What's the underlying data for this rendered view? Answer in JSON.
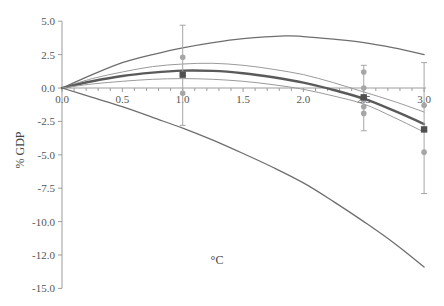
{
  "chart_data": {
    "type": "line",
    "title": "",
    "xlabel": "°C",
    "ylabel": "% GDP",
    "xlim": [
      0,
      3.0
    ],
    "ylim": [
      -15.0,
      5.0
    ],
    "grid": false,
    "legend": null,
    "x_ticks": [
      "0.0",
      "0.5",
      "1.0",
      "1.5",
      "2.0",
      "2.5",
      "3.0"
    ],
    "y_ticks": [
      "5.0",
      "2.5",
      "0.0",
      "-2.5",
      "-5.0",
      "-7.5",
      "-10.0",
      "-12.0",
      "-15.0"
    ],
    "y_tick_values": [
      5.0,
      2.5,
      0.0,
      -2.5,
      -5.0,
      -7.5,
      -10.0,
      -12.5,
      -15.0
    ],
    "series": [
      {
        "name": "upper bound",
        "style": "thin-dark",
        "color": "#6e6e6e",
        "width": 1.3,
        "x": [
          0,
          0.25,
          0.5,
          0.75,
          1.0,
          1.25,
          1.5,
          1.85,
          2.0,
          2.25,
          2.5,
          2.75,
          3.0
        ],
        "y": [
          0,
          1.0,
          1.9,
          2.5,
          3.0,
          3.4,
          3.7,
          3.9,
          3.85,
          3.65,
          3.4,
          3.0,
          2.5
        ]
      },
      {
        "name": "upper central",
        "style": "thin-light",
        "color": "#9a9a9a",
        "width": 1.0,
        "x": [
          0,
          0.25,
          0.5,
          0.75,
          1.0,
          1.25,
          1.5,
          1.75,
          2.0,
          2.25,
          2.5,
          2.75,
          3.0
        ],
        "y": [
          0,
          0.7,
          1.2,
          1.6,
          1.8,
          1.85,
          1.7,
          1.4,
          1.0,
          0.4,
          -0.3,
          -1.0,
          -1.8
        ]
      },
      {
        "name": "central estimate",
        "style": "thick",
        "color": "#5a5a5a",
        "width": 2.4,
        "x": [
          0,
          0.25,
          0.5,
          0.75,
          1.0,
          1.25,
          1.5,
          1.75,
          2.0,
          2.25,
          2.5,
          2.75,
          3.0
        ],
        "y": [
          0,
          0.5,
          0.9,
          1.15,
          1.3,
          1.28,
          1.1,
          0.8,
          0.4,
          -0.15,
          -0.8,
          -1.7,
          -2.7
        ]
      },
      {
        "name": "lower central",
        "style": "thin-light",
        "color": "#9a9a9a",
        "width": 1.0,
        "x": [
          0,
          0.25,
          0.5,
          0.75,
          1.0,
          1.25,
          1.5,
          1.75,
          2.0,
          2.25,
          2.5,
          2.75,
          3.0
        ],
        "y": [
          0,
          0.3,
          0.5,
          0.65,
          0.7,
          0.65,
          0.5,
          0.25,
          -0.1,
          -0.6,
          -1.2,
          -2.2,
          -3.3
        ]
      },
      {
        "name": "lower bound",
        "style": "thin-dark",
        "color": "#6e6e6e",
        "width": 1.3,
        "x": [
          0,
          0.25,
          0.5,
          0.75,
          1.0,
          1.25,
          1.5,
          1.75,
          2.0,
          2.25,
          2.5,
          2.75,
          3.0
        ],
        "y": [
          0,
          -0.7,
          -1.4,
          -2.2,
          -3.0,
          -3.9,
          -4.9,
          -5.95,
          -7.1,
          -8.5,
          -10.0,
          -11.6,
          -13.4
        ]
      }
    ],
    "error_bars": [
      {
        "x": 1.0,
        "mean": 1.0,
        "upper": 4.7,
        "lower": -2.8,
        "points": [
          2.3,
          -0.4
        ]
      },
      {
        "x": 2.5,
        "mean": -0.7,
        "upper": 1.7,
        "lower": -3.2,
        "points": [
          1.2,
          0.0,
          -0.9,
          -1.4,
          -1.9
        ]
      },
      {
        "x": 3.0,
        "mean": -3.1,
        "upper": 1.9,
        "lower": -7.9,
        "points": [
          -1.3,
          -4.8
        ]
      }
    ],
    "colors": {
      "axis": "#9c9c9c",
      "error_bar": "#a6a6a6",
      "point": "#a6a6a6",
      "mean_marker": "#505050"
    }
  }
}
